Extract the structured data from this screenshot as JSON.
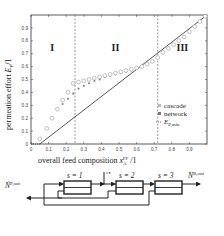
{
  "chart_data": {
    "type": "scatter",
    "title": "",
    "xlabel": "overall feed composition x_A^FF / 1",
    "ylabel": "permeation effort E_P / 1",
    "xlim": [
      0,
      1
    ],
    "ylim": [
      0,
      1
    ],
    "x_ticks": [
      "0",
      "0.1",
      "0.2",
      "0.3",
      "0.4",
      "0.5",
      "0.6",
      "0.7",
      "0.8",
      "0.9"
    ],
    "y_ticks": [
      "0",
      "0.1",
      "0.2",
      "0.3",
      "0.4",
      "0.5",
      "0.6",
      "0.7",
      "0.8",
      "0.9"
    ],
    "grid": false,
    "legend_position": "lower right",
    "regions": [
      {
        "label": "I",
        "x_range": [
          0,
          0.25
        ]
      },
      {
        "label": "II",
        "x_range": [
          0.25,
          0.72
        ]
      },
      {
        "label": "III",
        "x_range": [
          0.72,
          1.0
        ]
      }
    ],
    "region_boundaries": [
      0.25,
      0.72
    ],
    "series": [
      {
        "name": "cascade",
        "marker": "open-circle",
        "x": [
          0.05,
          0.09,
          0.12,
          0.15,
          0.18,
          0.21,
          0.24,
          0.27,
          0.3,
          0.33,
          0.36,
          0.39,
          0.42,
          0.45,
          0.48,
          0.51,
          0.54,
          0.57,
          0.6,
          0.63,
          0.66,
          0.69,
          0.72,
          0.75,
          0.78,
          0.81,
          0.84,
          0.87,
          0.9,
          0.93,
          0.96,
          0.99
        ],
        "y": [
          0.04,
          0.12,
          0.2,
          0.27,
          0.34,
          0.4,
          0.47,
          0.48,
          0.49,
          0.5,
          0.51,
          0.52,
          0.53,
          0.54,
          0.55,
          0.56,
          0.57,
          0.58,
          0.59,
          0.6,
          0.62,
          0.64,
          0.67,
          0.71,
          0.74,
          0.77,
          0.8,
          0.83,
          0.87,
          0.91,
          0.95,
          0.99
        ]
      },
      {
        "name": "network",
        "marker": "filled-circle",
        "x": [
          0.05,
          0.09,
          0.12,
          0.15,
          0.18,
          0.21,
          0.24,
          0.27,
          0.3,
          0.33,
          0.36,
          0.39,
          0.42,
          0.45,
          0.48,
          0.51,
          0.54,
          0.57,
          0.6,
          0.63,
          0.66,
          0.69,
          0.72,
          0.75,
          0.78,
          0.81,
          0.84,
          0.87,
          0.9,
          0.93,
          0.96,
          0.99
        ],
        "y": [
          0.04,
          0.12,
          0.2,
          0.27,
          0.31,
          0.35,
          0.39,
          0.43,
          0.45,
          0.47,
          0.49,
          0.5,
          0.52,
          0.53,
          0.54,
          0.55,
          0.56,
          0.57,
          0.59,
          0.6,
          0.62,
          0.64,
          0.67,
          0.71,
          0.74,
          0.77,
          0.8,
          0.83,
          0.87,
          0.91,
          0.95,
          0.99
        ]
      },
      {
        "name": "E_P,min",
        "marker": "line",
        "x": [
          0.05,
          1.0
        ],
        "y": [
          0.0,
          1.0
        ]
      }
    ]
  },
  "chart": {
    "region_labels": [
      "I",
      "II",
      "III"
    ],
    "x_axis_label_prefix": "overall feed composition ",
    "x_axis_var": "x",
    "x_axis_sub": "A",
    "x_axis_sup": "FF",
    "x_axis_suffix": " /1",
    "y_axis_label_prefix": "permeation effort ",
    "y_axis_var": "E",
    "y_axis_sub": "P",
    "y_axis_suffix": "/1",
    "legend": {
      "cascade": "cascade",
      "network": "network",
      "epmin_var": "E",
      "epmin_sub": "P,min"
    }
  },
  "diagram": {
    "stages": [
      "s = 1",
      "s = 2",
      "s = 3"
    ],
    "permeate_out_var": "Ṅ",
    "permeate_out_sup": "P,out",
    "feed_var": "Ṅ",
    "feed_sup": "FF",
    "retentate_out_var": "Ṅ",
    "retentate_out_sup": "R,out"
  }
}
